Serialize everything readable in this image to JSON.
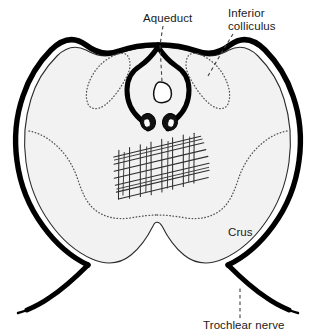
{
  "figure": {
    "kind": "anatomical-cross-section",
    "background_color": "#ffffff",
    "tissue_fill_color": "#f2f2f2",
    "outline_color": "#000000",
    "dotted_contour_color": "#555555",
    "leader_line_color": "#404040"
  },
  "labels": {
    "aqueduct": {
      "text": "Aqueduct",
      "x": 143,
      "y": 22,
      "anchor": "start"
    },
    "inferior_colliculus": {
      "line1": "Inferior",
      "line2": "colliculus",
      "x": 228,
      "y1": 17,
      "y2": 30,
      "anchor": "start"
    },
    "crus": {
      "text": "Crus",
      "x": 228,
      "y": 236,
      "anchor": "start"
    },
    "trochlear_nerve": {
      "text": "Trochlear nerve",
      "x": 203,
      "y": 329,
      "anchor": "start"
    }
  },
  "structures": {
    "aqueduct_lumen": "small rounded lumen at center, white fill, black outline",
    "trochlear_nuclei": "paired dark oval nuclei beneath the aqueduct",
    "periaqueductal_gray": "thick inverted-U outline surrounding the aqueduct",
    "decussation_hatching": "hand-drawn crosshatch grid marking the decussation of superior cerebellar peduncles",
    "inferior_colliculus_left": "dotted contour, dorsolateral left",
    "inferior_colliculus_right": "dotted contour, dorsolateral right",
    "crus_cerebri_left": "dotted boundary sweeping ventrolaterally on the left",
    "crus_cerebri_right": "dotted boundary sweeping ventrolaterally on the right",
    "trochlear_nerve_fibers": "thick tapering black strokes emerging at the inferior-lateral margins"
  }
}
